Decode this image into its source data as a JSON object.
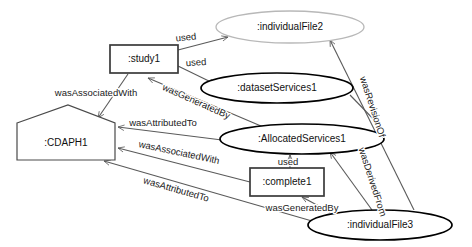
{
  "diagram": {
    "width": 472,
    "height": 247,
    "background": "#ffffff"
  },
  "nodes": [
    {
      "id": "individualFile2",
      "label": ":individualFile2",
      "type": "entity",
      "shape": "ellipse",
      "cx": 290,
      "cy": 27,
      "rx": 74,
      "ry": 16,
      "stroke": "#b8b8b8",
      "style": "light"
    },
    {
      "id": "study1",
      "label": ":study1",
      "type": "activity",
      "shape": "rectangle",
      "x": 110,
      "y": 45,
      "w": 68,
      "h": 28,
      "stroke": "#3a3a3a",
      "style": "dark"
    },
    {
      "id": "datasetServices1",
      "label": ":datasetServices1",
      "type": "entity",
      "shape": "ellipse",
      "cx": 277,
      "cy": 88,
      "rx": 76,
      "ry": 15,
      "stroke": "#000000",
      "style": "dark"
    },
    {
      "id": "CDAPH1",
      "label": ":CDAPH1",
      "type": "agent",
      "shape": "pentagon",
      "x": 17,
      "y": 105,
      "w": 98,
      "h": 55,
      "stroke": "#4a4a4a",
      "style": "light"
    },
    {
      "id": "AllocatedServices1",
      "label": ":AllocatedServices1",
      "type": "entity",
      "shape": "ellipse",
      "cx": 302,
      "cy": 139,
      "rx": 82,
      "ry": 15,
      "stroke": "#000000",
      "style": "dark"
    },
    {
      "id": "complete1",
      "label": ":complete1",
      "type": "activity",
      "shape": "rectangle",
      "x": 250,
      "y": 168,
      "w": 74,
      "h": 28,
      "stroke": "#3a3a3a",
      "style": "dark"
    },
    {
      "id": "individualFile3",
      "label": ":individualFile3",
      "type": "entity",
      "shape": "ellipse",
      "cx": 380,
      "cy": 225,
      "rx": 72,
      "ry": 15,
      "stroke": "#000000",
      "style": "dark"
    }
  ],
  "edges": [
    {
      "id": "study1-used-individualFile2",
      "label": "used",
      "from": "study1",
      "to": "individualFile2",
      "path": "M 178 50 L 228 37",
      "label_x": 186,
      "label_y": 38,
      "label_rotate": -6
    },
    {
      "id": "study1-used-datasetServices1",
      "label": "used",
      "from": "study1",
      "to": "datasetServices1",
      "path": "M 178 66 L 215 84",
      "label_x": 196,
      "label_y": 63,
      "label_rotate": -4
    },
    {
      "id": "study1-wasAssociatedWith-CDAPH1",
      "label": "wasAssociatedWith",
      "from": "study1",
      "to": "CDAPH1",
      "path": "M 128 74 L 98 118",
      "label_x": 96,
      "label_y": 93,
      "label_rotate": 0
    },
    {
      "id": "AllocatedServices1-wasGeneratedBy-study1",
      "label": "wasGeneratedBy",
      "from": "AllocatedServices1",
      "to": "study1",
      "path": "M 268 129 L 148 78",
      "label_x": 196,
      "label_y": 102,
      "label_rotate": 24
    },
    {
      "id": "AllocatedServices1-wasAttributedTo-CDAPH1",
      "label": "wasAttributedTo",
      "from": "AllocatedServices1",
      "to": "CDAPH1",
      "path": "M 222 140 L 118 127",
      "label_x": 163,
      "label_y": 123,
      "label_rotate": 0
    },
    {
      "id": "complete1-wasAssociatedWith-CDAPH1",
      "label": "wasAssociatedWith",
      "from": "complete1",
      "to": "CDAPH1",
      "path": "M 250 182 L 118 148",
      "label_x": 179,
      "label_y": 153,
      "label_rotate": 12
    },
    {
      "id": "individualFile3-wasAttributedTo-CDAPH1",
      "label": "wasAttributedTo",
      "from": "individualFile3",
      "to": "CDAPH1",
      "path": "M 312 221 L 104 161",
      "label_x": 176,
      "label_y": 190,
      "label_rotate": 16
    },
    {
      "id": "complete1-used-AllocatedServices1",
      "label": "used",
      "from": "complete1",
      "to": "AllocatedServices1",
      "path": "M 290 168 L 290 155",
      "label_x": 288,
      "label_y": 162,
      "label_rotate": 0
    },
    {
      "id": "individualFile3-wasGeneratedBy-complete1",
      "label": "wasGeneratedBy",
      "from": "individualFile3",
      "to": "complete1",
      "path": "M 330 212 L 302 197",
      "label_x": 302,
      "label_y": 208,
      "label_rotate": 0
    },
    {
      "id": "individualFile3-wasDerivedFrom-AllocatedServices1",
      "label": "wasDerivedFrom",
      "from": "individualFile3",
      "to": "AllocatedServices1",
      "path": "M 372 210 L 330 152",
      "label_x": 372,
      "label_y": 182,
      "label_rotate": 72
    },
    {
      "id": "individualFile3-wasRevisionOf-individualFile2",
      "label": "wasRevisionOf",
      "from": "individualFile3",
      "to": "individualFile2",
      "path": "M 414 210 L 330 40",
      "label_x": 372,
      "label_y": 107,
      "label_rotate": 72
    }
  ],
  "extra_edges": [
    {
      "id": "datasetServices1-to-AllocatedServices1-link",
      "path": "M 350 95 L 382 128"
    }
  ]
}
